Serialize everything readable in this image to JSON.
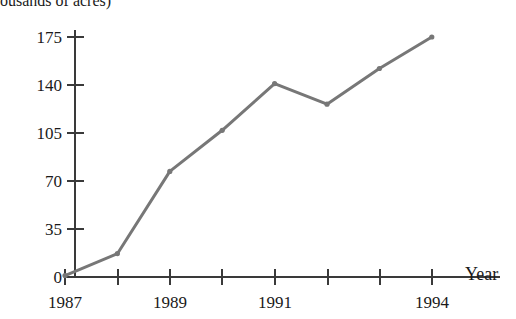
{
  "figure": {
    "title_partial": "ousands of acres)",
    "background_color": "#ffffff",
    "line_color": "#777777",
    "axis_color": "#3a3a3a",
    "text_color": "#1a1a1a"
  },
  "axes": {
    "x_axis_title": "Year",
    "y_tick_labels": [
      "175",
      "140",
      "105",
      "70",
      "35",
      "0"
    ],
    "x_tick_labels": [
      "1987",
      "1989",
      "1991",
      "1994"
    ]
  },
  "chart_data": {
    "type": "line",
    "title": "ousands of acres)",
    "xlabel": "Year",
    "ylabel": "",
    "categories": [
      "1987",
      "1988",
      "1989",
      "1990",
      "1991",
      "1992",
      "1993",
      "1994"
    ],
    "x": [
      1987,
      1988,
      1989,
      1990,
      1991,
      1992,
      1993,
      1994
    ],
    "values": [
      1,
      17,
      77,
      107,
      141,
      126,
      152,
      175
    ],
    "series": [
      {
        "name": "acres",
        "values": [
          1,
          17,
          77,
          107,
          141,
          126,
          152,
          175
        ]
      }
    ],
    "ylim": [
      0,
      186
    ],
    "xlim": [
      1987,
      1994
    ],
    "y_ticks": [
      0,
      35,
      70,
      105,
      140,
      175
    ],
    "x_ticks": [
      1987,
      1988,
      1989,
      1990,
      1991,
      1992,
      1993,
      1994
    ],
    "x_ticks_labeled": [
      1987,
      1989,
      1991,
      1994
    ],
    "grid": false,
    "legend": false,
    "markers": true,
    "line_color": "#777777"
  }
}
